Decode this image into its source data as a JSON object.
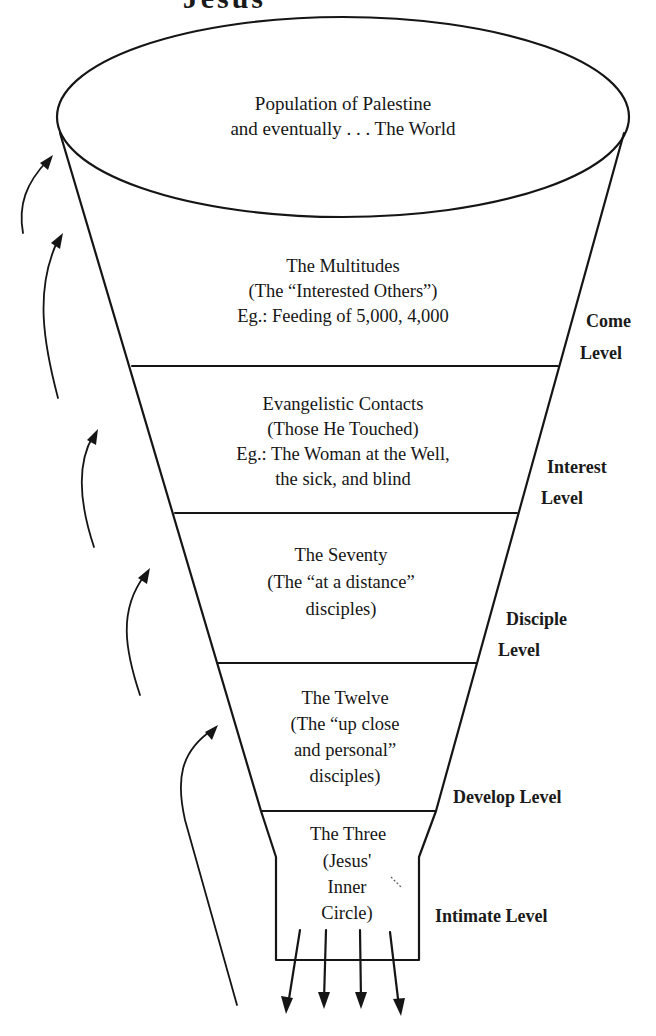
{
  "title": {
    "text": "Jesus' Ministry",
    "visible_fragment": "Jesus'"
  },
  "funnel": {
    "top": {
      "lines": [
        "Population of Palestine",
        "and eventually . . . The World"
      ]
    },
    "tiers": [
      {
        "name": "multitudes",
        "lines": [
          "The Multitudes",
          "(The “Interested Others”)",
          "Eg.: Feeding of 5,000, 4,000"
        ],
        "level_lines": [
          "Come",
          "Level"
        ]
      },
      {
        "name": "evangelistic-contacts",
        "lines": [
          "Evangelistic Contacts",
          "(Those He Touched)",
          "Eg.: The Woman at the Well,",
          "the sick, and blind"
        ],
        "level_lines": [
          "Interest",
          "Level"
        ]
      },
      {
        "name": "seventy",
        "lines": [
          "The Seventy",
          "(The “at a distance”",
          "disciples)"
        ],
        "level_lines": [
          "Disciple",
          "Level"
        ]
      },
      {
        "name": "twelve",
        "lines": [
          "The Twelve",
          "(The “up close",
          "and personal”",
          "disciples)"
        ],
        "level_lines": [
          "Develop Level"
        ]
      },
      {
        "name": "three",
        "lines": [
          "The Three",
          "(Jesus'",
          "Inner",
          "Circle)"
        ],
        "level_lines": [
          "Intimate Level"
        ]
      }
    ]
  },
  "arrows": {
    "left_upward_count": 5,
    "bottom_downward_count": 4
  },
  "colors": {
    "ink": "#151515",
    "background": "#ffffff"
  }
}
